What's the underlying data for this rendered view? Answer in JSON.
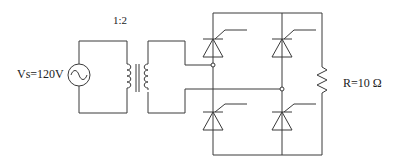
{
  "diagram": {
    "source": {
      "label": "Vs=120V",
      "symbol": "ac-source-icon"
    },
    "transformer": {
      "ratio_label": "1:2"
    },
    "load": {
      "label": "R=10 Ω",
      "symbol": "resistor"
    },
    "bridge": {
      "devices": [
        "thyristor-upper-left",
        "thyristor-upper-right",
        "thyristor-lower-left",
        "thyristor-lower-right"
      ]
    },
    "colors": {
      "line": "#3a3a3a",
      "background": "#ffffff"
    }
  }
}
